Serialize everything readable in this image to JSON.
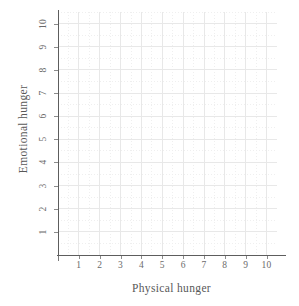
{
  "chart_data": {
    "type": "scatter",
    "title": "",
    "subtitle": "",
    "xlabel": "Physical hunger",
    "ylabel": "Emotional hunger",
    "x": [],
    "y": [],
    "series": [],
    "xlim": [
      0,
      10.5
    ],
    "ylim": [
      0,
      10.5
    ],
    "xticks": [
      1,
      2,
      3,
      4,
      5,
      6,
      7,
      8,
      9,
      10
    ],
    "yticks": [
      1,
      2,
      3,
      4,
      5,
      6,
      7,
      8,
      9,
      10
    ],
    "xtick_labels": [
      "1",
      "2",
      "3",
      "4",
      "5",
      "6",
      "7",
      "8",
      "9",
      "10"
    ],
    "ytick_labels": [
      "1",
      "2",
      "3",
      "4",
      "5",
      "6",
      "7",
      "8",
      "9",
      "10"
    ],
    "grid": true,
    "grid_major_color": "#e8e8e8",
    "grid_minor_color": "#efefef",
    "grid_minor_style": "dotted",
    "legend": null,
    "legend_position": "none",
    "annotations": [],
    "axis_color": "#5d5d5d",
    "tick_label_color": "#6b6b6b",
    "axis_label_color": "#585858",
    "background_color": "#ffffff",
    "note": "Empty plotting grid with no plotted data points"
  },
  "axes": {
    "x": {
      "title": "Physical hunger",
      "ticks": [
        "1",
        "2",
        "3",
        "4",
        "5",
        "6",
        "7",
        "8",
        "9",
        "10"
      ]
    },
    "y": {
      "title": "Emotional hunger",
      "ticks": [
        "1",
        "2",
        "3",
        "4",
        "5",
        "6",
        "7",
        "8",
        "9",
        "10"
      ]
    }
  }
}
